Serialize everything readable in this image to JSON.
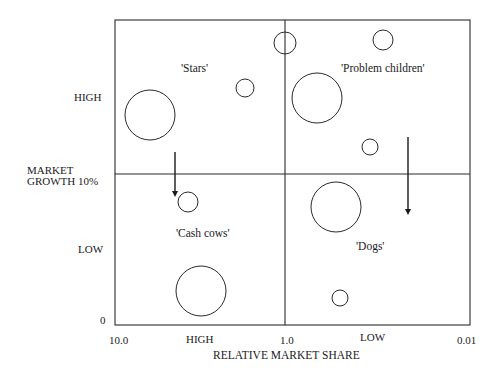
{
  "chart_data": {
    "type": "diagram",
    "xlabel": "RELATIVE MARKET SHARE",
    "ylabel": "MARKET GROWTH",
    "x_ticks": [
      "10.0",
      "HIGH",
      "1.0",
      "LOW",
      "0.01"
    ],
    "y_ticks": [
      "HIGH",
      "10%",
      "LOW",
      "0"
    ],
    "quadrants": [
      "'Stars'",
      "'Problem children'",
      "'Cash cows'",
      "'Dogs'"
    ],
    "circles": [
      {
        "quadrant": "Stars",
        "cx": 150,
        "cy": 115,
        "r": 25
      },
      {
        "quadrant": "Stars",
        "cx": 245,
        "cy": 88,
        "r": 9
      },
      {
        "quadrant": "Stars/Problem children boundary",
        "cx": 285,
        "cy": 43,
        "r": 11
      },
      {
        "quadrant": "Problem children",
        "cx": 383,
        "cy": 40,
        "r": 10
      },
      {
        "quadrant": "Problem children",
        "cx": 317,
        "cy": 98,
        "r": 25
      },
      {
        "quadrant": "Problem children",
        "cx": 370,
        "cy": 147,
        "r": 8
      },
      {
        "quadrant": "Cash cows",
        "cx": 188,
        "cy": 202,
        "r": 10
      },
      {
        "quadrant": "Cash cows",
        "cx": 201,
        "cy": 291,
        "r": 25
      },
      {
        "quadrant": "Dogs",
        "cx": 336,
        "cy": 207,
        "r": 25
      },
      {
        "quadrant": "Dogs",
        "cx": 340,
        "cy": 298,
        "r": 8
      }
    ],
    "arrows": [
      {
        "from": "Stars",
        "to": "Cash cows",
        "x": 175,
        "y1": 152,
        "y2": 197
      },
      {
        "from": "Problem children",
        "to": "Dogs",
        "x": 408,
        "y1": 137,
        "y2": 215
      }
    ],
    "grid": false
  },
  "labels": {
    "stars": "'Stars'",
    "problem_children": "'Problem children'",
    "cash_cows": "'Cash cows'",
    "dogs": "'Dogs'",
    "y_high": "HIGH",
    "y_market": "MARKET",
    "y_growth": "GROWTH 10%",
    "y_low": "LOW",
    "y_zero": "0",
    "x_10": "10.0",
    "x_high": "HIGH",
    "x_1": "1.0",
    "x_low": "LOW",
    "x_001": "0.01",
    "x_title": "RELATIVE MARKET SHARE"
  },
  "colors": {
    "line": "#2a2a2a",
    "background": "#ffffff"
  }
}
